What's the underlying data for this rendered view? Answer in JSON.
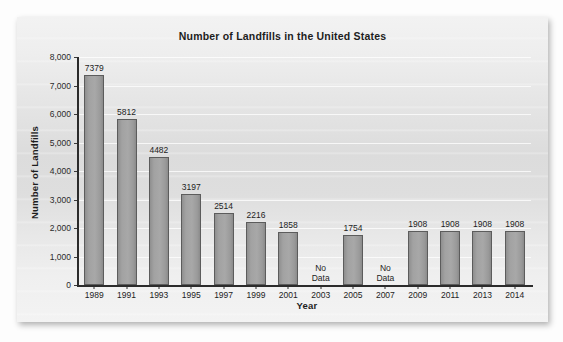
{
  "chart_data": {
    "type": "bar",
    "title": "Number of Landfills in the United States",
    "xlabel": "Year",
    "ylabel": "Number of Landfills",
    "ylim": [
      0,
      8000
    ],
    "ytick_labels": [
      "8,000",
      "7,000",
      "6,000",
      "5,000",
      "4,000",
      "3,000",
      "2,000",
      "1,000",
      "0"
    ],
    "ytick_values": [
      8000,
      7000,
      6000,
      5000,
      4000,
      3000,
      2000,
      1000,
      0
    ],
    "grid": true,
    "legend": null,
    "categories": [
      "1989",
      "1991",
      "1993",
      "1995",
      "1997",
      "1999",
      "2001",
      "2003",
      "2005",
      "2007",
      "2009",
      "2011",
      "2013",
      "2014"
    ],
    "values": [
      7379,
      5812,
      4482,
      3197,
      2514,
      2216,
      1858,
      null,
      1754,
      null,
      1908,
      1908,
      1908,
      1908
    ],
    "data_labels": [
      "7379",
      "5812",
      "4482",
      "3197",
      "2514",
      "2216",
      "1858",
      null,
      "1754",
      null,
      "1908",
      "1908",
      "1908",
      "1908"
    ],
    "missing_label": "No\nData",
    "missing_label_lines": [
      "No",
      "Data"
    ],
    "bars": [
      {
        "category": "1989",
        "value": 7379,
        "label": "7379",
        "has_data": true
      },
      {
        "category": "1991",
        "value": 5812,
        "label": "5812",
        "has_data": true
      },
      {
        "category": "1993",
        "value": 4482,
        "label": "4482",
        "has_data": true
      },
      {
        "category": "1995",
        "value": 3197,
        "label": "3197",
        "has_data": true
      },
      {
        "category": "1997",
        "value": 2514,
        "label": "2514",
        "has_data": true
      },
      {
        "category": "1999",
        "value": 2216,
        "label": "2216",
        "has_data": true
      },
      {
        "category": "2001",
        "value": 1858,
        "label": "1858",
        "has_data": true
      },
      {
        "category": "2003",
        "value": null,
        "label": null,
        "has_data": false
      },
      {
        "category": "2005",
        "value": 1754,
        "label": "1754",
        "has_data": true
      },
      {
        "category": "2007",
        "value": null,
        "label": null,
        "has_data": false
      },
      {
        "category": "2009",
        "value": 1908,
        "label": "1908",
        "has_data": true
      },
      {
        "category": "2011",
        "value": 1908,
        "label": "1908",
        "has_data": true
      },
      {
        "category": "2013",
        "value": 1908,
        "label": "1908",
        "has_data": true
      },
      {
        "category": "2014",
        "value": 1908,
        "label": "1908",
        "has_data": true
      }
    ],
    "colors": {
      "bar_fill": "#a2a2a2",
      "bar_border": "#5c5c5c",
      "text": "#1d1d1d",
      "axis": "#2b2b2b",
      "gridline": "#ffffff",
      "panel_background": "#e4e4e4"
    }
  }
}
